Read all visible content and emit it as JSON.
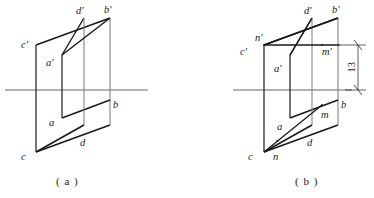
{
  "figure": {
    "background_color": "#ffffff",
    "stroke_color": "#1a1a1a",
    "thin_stroke_color": "#555555",
    "width": 374,
    "height": 198
  },
  "panel_a": {
    "caption": "( a )",
    "labels": {
      "c_prime": "c'",
      "d_prime": "d'",
      "b_prime": "b'",
      "a_prime": "a'",
      "a": "a",
      "b": "b",
      "c": "c",
      "d": "d"
    },
    "geometry": {
      "ground_line": {
        "x1": 5,
        "y1": 90,
        "x2": 148,
        "y2": 90
      },
      "large_parallelogram": [
        {
          "x": 36,
          "y": 45
        },
        {
          "x": 110,
          "y": 18
        },
        {
          "x": 110,
          "y": 125
        },
        {
          "x": 36,
          "y": 152
        }
      ],
      "small_parallelogram": [
        {
          "x": 62,
          "y": 55
        },
        {
          "x": 84,
          "y": 18
        },
        {
          "x": 84,
          "y": 125
        },
        {
          "x": 62,
          "y": 118
        }
      ]
    }
  },
  "panel_b": {
    "caption": "( b )",
    "labels": {
      "c_prime": "c'",
      "n_prime": "n'",
      "d_prime": "d'",
      "b_prime": "b'",
      "m_prime": "m'",
      "a_prime": "a'",
      "a": "a",
      "b": "b",
      "m": "m",
      "c": "c",
      "n": "n",
      "d": "d"
    },
    "dimension": {
      "value": "13",
      "from_y": 45,
      "to_y": 90,
      "x": 358
    },
    "geometry": {
      "ground_line": {
        "x1": 233,
        "y1": 90,
        "x2": 370,
        "y2": 90
      },
      "large_parallelogram": [
        {
          "x": 264,
          "y": 45
        },
        {
          "x": 338,
          "y": 18
        },
        {
          "x": 338,
          "y": 125
        },
        {
          "x": 264,
          "y": 152
        }
      ],
      "small_parallelogram": [
        {
          "x": 290,
          "y": 55
        },
        {
          "x": 312,
          "y": 18
        },
        {
          "x": 312,
          "y": 125
        },
        {
          "x": 290,
          "y": 118
        }
      ],
      "mn_front_line": {
        "x1": 264,
        "y1": 45,
        "x2": 338,
        "y2": 45
      },
      "mn_top_line": {
        "x1": 264,
        "y1": 152,
        "x2": 322,
        "y2": 120
      }
    }
  }
}
